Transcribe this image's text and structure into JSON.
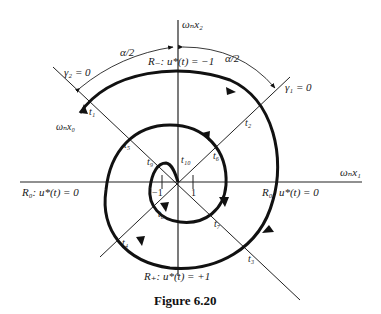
{
  "figure": {
    "caption": "Figure 6.20",
    "axes": {
      "x_label": "ωₙx₁",
      "y_label": "ωₙx₂"
    },
    "regions": {
      "r_minus": "R₋: u*(t) = −1",
      "r_plus": "R₊: u*(t) = +1",
      "r_zero_left": "R₀: u*(t) = 0",
      "r_zero_right": "R₀: u*(t) = 0"
    },
    "switching_lines": {
      "gamma1": "γ₁ = 0",
      "gamma2": "γ₂ = 0"
    },
    "angles": {
      "left": "α/2",
      "right": "α/2"
    },
    "initial_state": "ωₙx₀",
    "ticks": {
      "neg_one": "−1",
      "pos_one": "1"
    },
    "time_labels": {
      "t1": "t₁",
      "t2": "t₂",
      "t3": "t₃",
      "t4": "t₄",
      "t5": "t₅",
      "t6": "t₆",
      "t7": "t₇",
      "t8": "t₈",
      "t9": "t₉",
      "t10": "t₁₀"
    },
    "colors": {
      "ink": "#111111",
      "background": "#ffffff"
    }
  }
}
